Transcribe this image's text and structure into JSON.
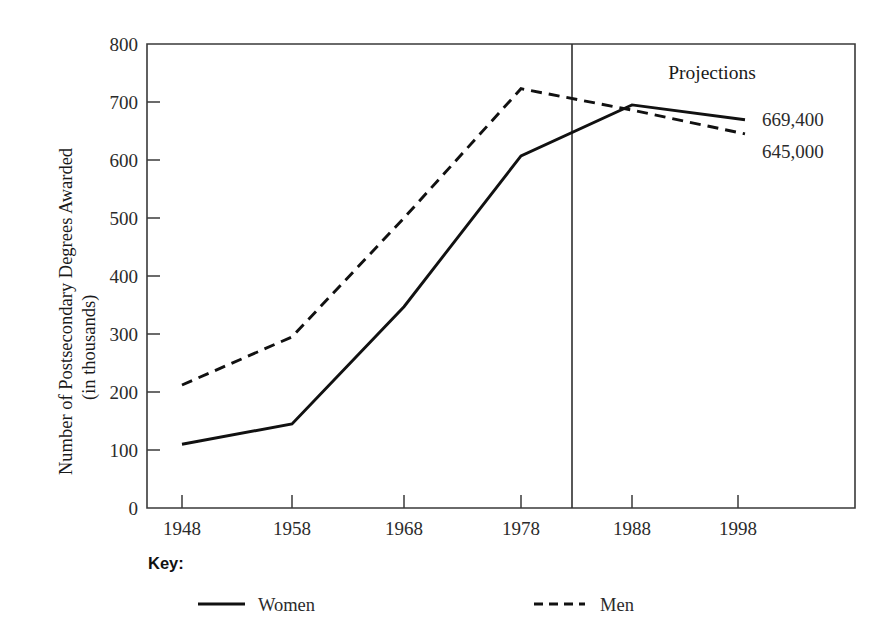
{
  "chart_data": {
    "type": "line",
    "title": "",
    "xlabel": "",
    "ylabel": "Number of Postsecondary Degrees Awarded",
    "ylabel_sub": "(in thousands)",
    "categories": [
      "1948",
      "1958",
      "1968",
      "1978",
      "1988",
      "1998"
    ],
    "x": [
      1948,
      1958,
      1968,
      1978,
      1988,
      1998
    ],
    "xlim": [
      1944,
      2002
    ],
    "ylim": [
      0,
      800
    ],
    "ytick_labels": [
      "0",
      "100",
      "200",
      "300",
      "400",
      "500",
      "600",
      "700",
      "800"
    ],
    "yticks": [
      0,
      100,
      200,
      300,
      400,
      500,
      600,
      700,
      800
    ],
    "grid": false,
    "legend_position": "bottom",
    "series": [
      {
        "name": "Women",
        "style": "solid",
        "values": [
          110,
          145,
          347,
          607,
          695,
          669.4
        ]
      },
      {
        "name": "Men",
        "style": "dashed",
        "values": [
          212,
          295,
          500,
          723,
          686,
          645.0
        ]
      }
    ],
    "annotations": [
      {
        "text": "Projections",
        "series": null
      },
      {
        "text": "669,400",
        "series": "Women"
      },
      {
        "text": "645,000",
        "series": "Men"
      }
    ],
    "projection_divider_year": 1983,
    "projection_divider_label": "Projections"
  },
  "axes": {
    "y_title_line1": "Number of Postsecondary Degrees Awarded",
    "y_title_line2": "(in thousands)",
    "y_ticks": [
      "800",
      "700",
      "600",
      "500",
      "400",
      "300",
      "200",
      "100",
      "0"
    ],
    "x_ticks": [
      "1948",
      "1958",
      "1968",
      "1978",
      "1988",
      "1998"
    ]
  },
  "annotations": {
    "projections": "Projections",
    "women_end_value": "669,400",
    "men_end_value": "645,000"
  },
  "legend": {
    "title": "Key:",
    "items": [
      {
        "label": "Women",
        "style": "solid"
      },
      {
        "label": "Men",
        "style": "dashed"
      }
    ]
  },
  "colors": {
    "line": "#111111",
    "frame": "#3a3a3a",
    "text": "#2b2b2b",
    "background": "#ffffff"
  }
}
